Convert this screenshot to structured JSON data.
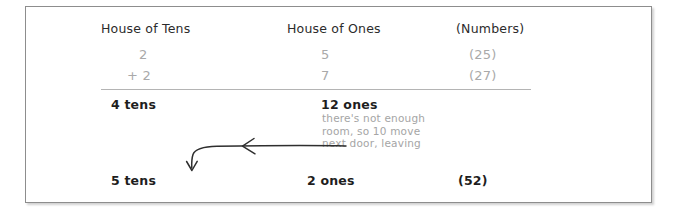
{
  "figure": {
    "kind": "place-value regrouping worksheet",
    "columns": {
      "tens_header": "House of Tens",
      "ones_header": "House of Ones",
      "numbers_header": "(Numbers)"
    },
    "addends": [
      {
        "tens": "2",
        "ones": "5",
        "number": "(25)"
      },
      {
        "tens": "+ 2",
        "ones": "7",
        "number": "(27)"
      }
    ],
    "sum_before_regroup": {
      "tens": "4 tens",
      "ones": "12 ones",
      "number": ""
    },
    "annotation": "there's not enough\nroom, so 10 move\nnext door, leaving",
    "sum_after_regroup": {
      "tens": "5 tens",
      "ones": "2  ones",
      "number": "(52)"
    },
    "arrow": {
      "name": "regroup-arrow",
      "description": "hand-drawn arrow curving left then down from the ones column to the tens column"
    },
    "colors": {
      "frame_border": "#8d8d8d",
      "rule": "#b4b4b4",
      "header_text": "#2b2b2b",
      "faint_text": "#a9a9a9",
      "bold_text": "#1e1e1e",
      "note_text": "#a5a5a5",
      "arrow": "#2e2e2e",
      "page_background": "#ffffff"
    }
  }
}
